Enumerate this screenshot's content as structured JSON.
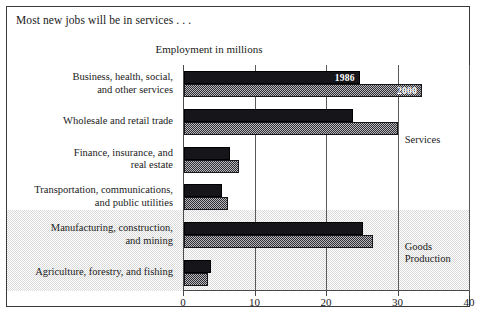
{
  "chart_data": {
    "type": "bar",
    "orientation": "horizontal",
    "title": "Most new jobs will be in services . . .",
    "xlabel": "Employment in millions",
    "ylabel": "",
    "xlim": [
      0,
      40
    ],
    "xticks": [
      0,
      10,
      20,
      30,
      40
    ],
    "grid": true,
    "legend_position": "inline-data-labels",
    "categories": [
      "Business, health, social,\nand other services",
      "Wholesale and retail trade",
      "Finance, insurance, and\nreal estate",
      "Transportation, communications,\nand public utilities",
      "Manufacturing, construction,\nand mining",
      "Agriculture, forestry, and fishing"
    ],
    "series": [
      {
        "name": "1986",
        "color": "#15151a",
        "values": [
          24.6,
          23.6,
          6.5,
          5.3,
          25.1,
          3.8
        ]
      },
      {
        "name": "2000",
        "color": "#2e2e33",
        "values": [
          33.3,
          29.9,
          7.7,
          6.1,
          26.5,
          3.3
        ]
      }
    ],
    "data_labels": [
      {
        "text": "1986",
        "series": "1986",
        "category_index": 0
      },
      {
        "text": "2000",
        "series": "2000",
        "category_index": 0
      }
    ],
    "annotations": [
      {
        "text": "Services",
        "group_categories": [
          0,
          1,
          2,
          3
        ]
      },
      {
        "text": "Goods\nProduction",
        "group_categories": [
          4,
          5
        ]
      }
    ],
    "shaded_band": {
      "label": "Goods Production",
      "category_indices": [
        4,
        5
      ],
      "color": "#d3d3d3"
    }
  }
}
